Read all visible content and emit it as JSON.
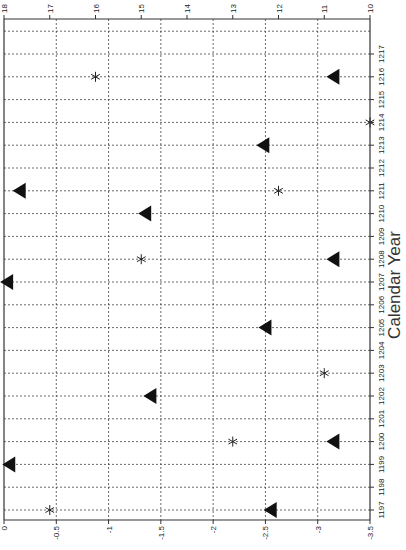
{
  "chart_data": {
    "type": "scatter",
    "orientation": "rotated-90-clockwise",
    "title": "",
    "xlabel": "Calendar Year",
    "ylabel": "",
    "x": [
      1197,
      1198,
      1199,
      1200,
      1201,
      1202,
      1203,
      1204,
      1205,
      1206,
      1207,
      1208,
      1209,
      1210,
      1211,
      1212,
      1213,
      1214,
      1215,
      1216,
      1217
    ],
    "x_tick_labels": [
      "1197",
      "1198",
      "1199",
      "1200",
      "1201",
      "1202",
      "1203",
      "1204",
      "1205",
      "1206",
      "1207",
      "1208",
      "1209",
      "1210",
      "1211",
      "1212",
      "1213",
      "1214",
      "1215",
      "1216",
      "1217"
    ],
    "top_axis": {
      "ticks": [
        "18",
        "17",
        "16",
        "15",
        "14",
        "13",
        "12",
        "11",
        "10"
      ],
      "range": [
        18,
        10
      ]
    },
    "bottom_axis": {
      "ticks": [
        "0",
        "-0.5",
        "-1",
        "-1.5",
        "-2",
        "-2.5",
        "-3",
        "-3.5"
      ],
      "range": [
        0,
        -3.5
      ]
    },
    "grid": true,
    "series": [
      {
        "name": "stars",
        "marker": "asterisk",
        "axis": "top",
        "points": [
          {
            "year": 1197,
            "value": 17
          },
          {
            "year": 1200,
            "value": 13
          },
          {
            "year": 1203,
            "value": 11
          },
          {
            "year": 1208,
            "value": 15
          },
          {
            "year": 1211,
            "value": 12
          },
          {
            "year": 1214,
            "value": 10
          },
          {
            "year": 1216,
            "value": 16
          }
        ]
      },
      {
        "name": "triangles",
        "marker": "triangle-left-filled",
        "axis": "bottom",
        "points": [
          {
            "year": 1197,
            "value": -2.55
          },
          {
            "year": 1199,
            "value": -0.05
          },
          {
            "year": 1200,
            "value": -3.15
          },
          {
            "year": 1202,
            "value": -1.4
          },
          {
            "year": 1205,
            "value": -2.5
          },
          {
            "year": 1207,
            "value": -0.03
          },
          {
            "year": 1208,
            "value": -3.15
          },
          {
            "year": 1210,
            "value": -1.35
          },
          {
            "year": 1211,
            "value": -0.15
          },
          {
            "year": 1213,
            "value": -2.48
          },
          {
            "year": 1216,
            "value": -3.15
          }
        ]
      }
    ]
  },
  "labels": {
    "year_axis_title": "Calendar Year"
  }
}
